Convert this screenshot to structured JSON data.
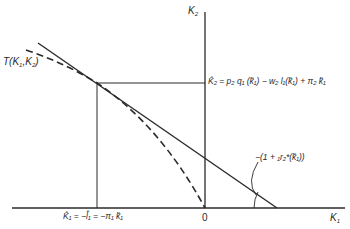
{
  "figure": {
    "axes": {
      "y_axis_label": "K",
      "y_axis_label_sub": "2",
      "x_axis_label": "K",
      "x_axis_label_sub": "1",
      "origin_label": "0"
    },
    "curve_label": {
      "prefix": "T(K",
      "sub1": "1",
      "mid": ",K",
      "sub2": "2",
      "suffix": ")"
    },
    "k2_hat_label": {
      "text": "K̂₂ = p₂ q₁ (k̂₁) − w₂ l₁(k̂₁) + π₂ k̂₁"
    },
    "k1_hat_label": {
      "text": "K̂₁ = −l̂₁ = −π₁ k̂₁"
    },
    "slope_label": {
      "text": "−(1 + ₁r₂*(k̂₁))"
    },
    "colors": {
      "ink": "#2a2a2a",
      "background": "#ffffff"
    }
  }
}
